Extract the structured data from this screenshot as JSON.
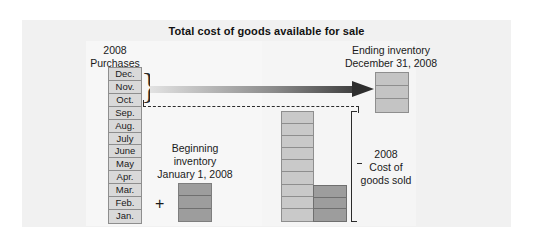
{
  "figure": {
    "title": "Total cost of goods available for sale",
    "background_color": "#f1f1f1",
    "panel_color": "#f7f7f7"
  },
  "purchases": {
    "year_label": "2008",
    "caption": "Purchases",
    "months": [
      "Dec.",
      "Nov.",
      "Oct.",
      "Sep.",
      "Aug.",
      "July",
      "June",
      "May",
      "Apr.",
      "Mar.",
      "Feb.",
      "Jan."
    ],
    "brace_glyph": "}",
    "brace_covers": [
      "Dec.",
      "Nov.",
      "Oct."
    ],
    "box_fill": "#d9d9d9",
    "box_border": "#8e8e8e"
  },
  "ending_inventory": {
    "line1": "Ending inventory",
    "line2": "December 31, 2008",
    "segments": 3,
    "fill": "#c4c4c4"
  },
  "beginning_inventory": {
    "line1": "Beginning",
    "line2": "inventory",
    "line3": "January 1, 2008",
    "plus_sign": "+",
    "segments": 3,
    "fill": "#9d9d9d"
  },
  "cost_of_goods_sold": {
    "line1": "2008",
    "line2": "Cost of",
    "line3": "goods sold",
    "light_segments": 9,
    "dark_segments": 3,
    "light_fill": "#c9c9c9",
    "dark_fill": "#9d9d9d",
    "bracket_color": "#2b2b2b"
  },
  "connectors": {
    "arrow_name": "purchases-to-ending-inventory-arrow",
    "arrow_gradient_from": "#e2e2e2",
    "arrow_gradient_to": "#2e2e2e",
    "dashed_line_color": "#2b2b2b"
  },
  "chart_data": {
    "type": "diagram",
    "title": "Total cost of goods available for sale",
    "components": [
      {
        "name": "Purchases",
        "label": "2008 Purchases",
        "units": "months",
        "values": [
          "Dec.",
          "Nov.",
          "Oct.",
          "Sep.",
          "Aug.",
          "July",
          "June",
          "May",
          "Apr.",
          "Mar.",
          "Feb.",
          "Jan."
        ],
        "count": 12
      },
      {
        "name": "Beginning inventory",
        "label": "Beginning inventory January 1, 2008",
        "units": "layers",
        "count": 3
      },
      {
        "name": "Ending inventory",
        "label": "Ending inventory December 31, 2008",
        "units": "layers",
        "count": 3
      },
      {
        "name": "Cost of goods sold",
        "label": "2008 Cost of goods sold",
        "units": "layers",
        "light_count": 9,
        "dark_count": 3,
        "count": 12
      }
    ],
    "relationship": "Beginning inventory + Purchases = Total cost of goods available for sale = Cost of goods sold + Ending inventory"
  }
}
